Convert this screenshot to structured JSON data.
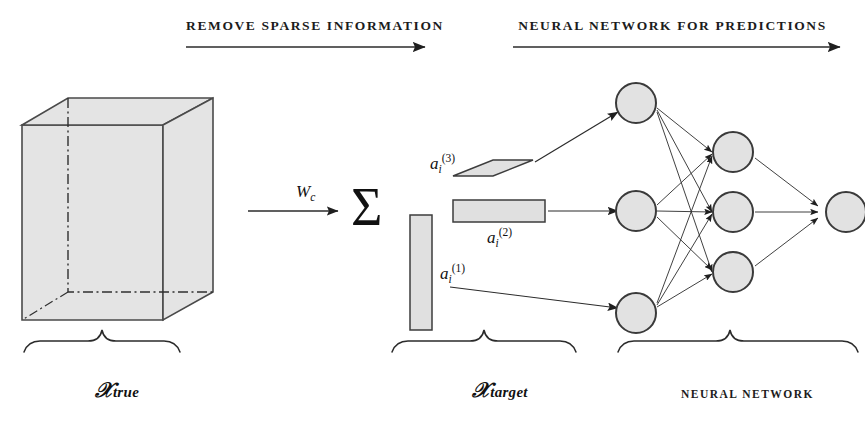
{
  "figure": {
    "type": "scientific-diagram",
    "title_top_left": "REMOVE SPARSE INFORMATION",
    "title_top_right": "NEURAL NETWORK FOR PREDICTIONS"
  },
  "headers": [
    {
      "id": "remove-sparse",
      "label": "REMOVE SPARSE INFORMATION"
    },
    {
      "id": "nn-predictions",
      "label": "NEURAL NETWORK FOR PREDICTIONS"
    }
  ],
  "stages": {
    "input_tensor": {
      "brace_label_symbol": "𝒳",
      "brace_label_subscript": "true",
      "shape": "cube",
      "fill_color": "#e3e3e3",
      "stroke_color": "#4a4a4a"
    },
    "decomposition": {
      "operator_symbol": "Σ",
      "arrow_label": "W",
      "arrow_label_subscript": "c",
      "brace_label_symbol": "𝒳",
      "brace_label_subscript": "target",
      "factors": [
        {
          "id": "factor-3",
          "base": "a",
          "sub": "i",
          "sup": "(3)",
          "shape": "parallelogram"
        },
        {
          "id": "factor-2",
          "base": "a",
          "sub": "i",
          "sup": "(2)",
          "shape": "horizontal-bar"
        },
        {
          "id": "factor-1",
          "base": "a",
          "sub": "i",
          "sup": "(1)",
          "shape": "vertical-bar"
        }
      ]
    },
    "network": {
      "caption": "NEURAL NETWORK",
      "layers": [
        {
          "id": "input-layer",
          "node_count": 3
        },
        {
          "id": "hidden-layer",
          "node_count": 3
        },
        {
          "id": "output-layer",
          "node_count": 1
        }
      ],
      "node_fill": "#e0e0e0",
      "node_stroke": "#3a3a3a"
    }
  },
  "colors": {
    "ink": "#1a1a1a",
    "shape_fill": "#e3e3e3",
    "shape_stroke": "#4a4a4a",
    "arrow": "#2b2b2b",
    "background": "#ffffff"
  }
}
